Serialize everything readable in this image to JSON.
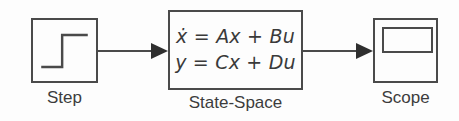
{
  "diagram": {
    "background_color": "#fdfdfd",
    "line_color": "#4a4a4a",
    "text_color": "#3c3c3c"
  },
  "blocks": {
    "step": {
      "label": "Step",
      "icon": "step-function-icon"
    },
    "state_space": {
      "label": "State-Space",
      "equation_1": "ẋ = Ax + Bu",
      "equation_2": "y = Cx + Du"
    },
    "scope": {
      "label": "Scope",
      "icon": "scope-screen-icon"
    }
  },
  "connectors": {
    "step_to_statespace": "signal-arrow",
    "statespace_to_scope": "signal-arrow"
  }
}
